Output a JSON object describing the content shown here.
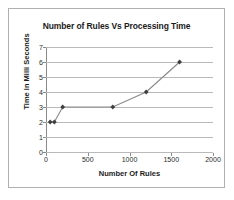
{
  "chart_data": {
    "type": "line",
    "title": "Number of Rules Vs Processing Time",
    "xlabel": "Number Of Rules",
    "ylabel": "Time in Milli Seconds",
    "xlim": [
      0,
      2000
    ],
    "ylim": [
      0,
      7
    ],
    "xticks": [
      0,
      500,
      1000,
      1500,
      2000
    ],
    "yticks": [
      0,
      1,
      2,
      3,
      4,
      5,
      6,
      7
    ],
    "grid": "horizontal",
    "legend": "none",
    "series": [
      {
        "name": "Processing Time",
        "x": [
          50,
          100,
          200,
          800,
          1200,
          1600
        ],
        "values": [
          2,
          2,
          3,
          3,
          4,
          6
        ],
        "line_color": "#8c8c8c",
        "marker_color": "#3f3f3f",
        "marker": "diamond"
      }
    ]
  },
  "frame": {
    "border_color": "#b0b0b0",
    "background": "#ffffff"
  }
}
